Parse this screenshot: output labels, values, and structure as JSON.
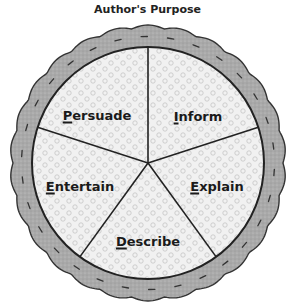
{
  "title": "Author's Purpose",
  "pie": {
    "center": [
      148,
      163
    ],
    "crust_outer_radius": 135,
    "filling_radius": 116,
    "colors": {
      "crust": "#a8a8a8",
      "filling": "#f0f0f0",
      "dots": "#bdbdbd",
      "lines": "#222222"
    },
    "slices": [
      {
        "label": "Persuade",
        "first": "P",
        "rest": "ersuade",
        "x": 97,
        "y": 115
      },
      {
        "label": "Inform",
        "first": "I",
        "rest": "nform",
        "x": 198,
        "y": 116
      },
      {
        "label": "Explain",
        "first": "E",
        "rest": "xplain",
        "x": 217,
        "y": 186
      },
      {
        "label": "Describe",
        "first": "D",
        "rest": "escribe",
        "x": 148,
        "y": 241
      },
      {
        "label": "Entertain",
        "first": "E",
        "rest": "ntertain",
        "x": 80,
        "y": 186
      }
    ]
  }
}
